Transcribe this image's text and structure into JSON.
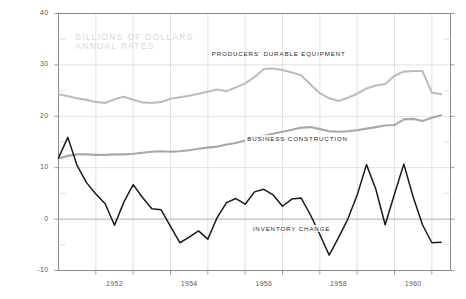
{
  "chart_data": {
    "type": "line",
    "title": "",
    "subtitle": "",
    "annotations": [
      {
        "id": "units",
        "line1": "BILLIONS OF DOLLARS",
        "line2": "ANNUAL RATES"
      }
    ],
    "xlabel": "",
    "ylabel": "",
    "ylim": [
      -10,
      40
    ],
    "xlim": [
      1951.0,
      1961.5
    ],
    "yticks": [
      -10,
      0,
      10,
      20,
      30,
      40
    ],
    "ytick_labels": [
      "-10",
      "0",
      "10",
      "20",
      "30",
      "40"
    ],
    "xticks": [
      1952,
      1954,
      1956,
      1958,
      1960
    ],
    "xtick_labels": [
      "1952",
      "1954",
      "1956",
      "1958",
      "1960"
    ],
    "x_gridlines": [
      1952,
      1953,
      1954,
      1955,
      1956,
      1957,
      1958,
      1959,
      1960,
      1961
    ],
    "y_gridlines": [
      0,
      10,
      20,
      30
    ],
    "grid": true,
    "legend_position": "inline-annotation",
    "zero_line": 0,
    "colors": {
      "producers_durable_equipment": "#bdbdbd",
      "business_construction": "#a8a8a8",
      "inventory_change": "#1a1a1a",
      "grid": "#d9d9d9",
      "axis": "#8c8c8c",
      "tick_text": "#5a5a5a",
      "watermark": "#d8d8d8",
      "background": "#ffffff"
    },
    "x": [
      1951.0,
      1951.25,
      1951.5,
      1951.75,
      1952.0,
      1952.25,
      1952.5,
      1952.75,
      1953.0,
      1953.25,
      1953.5,
      1953.75,
      1954.0,
      1954.25,
      1954.5,
      1954.75,
      1955.0,
      1955.25,
      1955.5,
      1955.75,
      1956.0,
      1956.25,
      1956.5,
      1956.75,
      1957.0,
      1957.25,
      1957.5,
      1957.75,
      1958.0,
      1958.25,
      1958.5,
      1958.75,
      1959.0,
      1959.25,
      1959.5,
      1959.75,
      1960.0,
      1960.25,
      1960.5,
      1960.75,
      1961.0,
      1961.25
    ],
    "series": [
      {
        "name": "PRODUCERS' DURABLE EQUIPMENT",
        "label_x": 1955.05,
        "label_y": 32.2,
        "color": "#bdbdbd",
        "width": 2.1,
        "values": [
          24.3,
          23.9,
          23.5,
          23.2,
          22.8,
          22.6,
          23.3,
          23.8,
          23.2,
          22.7,
          22.6,
          22.8,
          23.4,
          23.7,
          24.0,
          24.4,
          24.8,
          25.2,
          24.9,
          25.6,
          26.4,
          27.6,
          29.2,
          29.3,
          29.0,
          28.5,
          28.0,
          26.2,
          24.5,
          23.5,
          23.0,
          23.6,
          24.4,
          25.4,
          26.0,
          26.3,
          27.9,
          28.7,
          28.8,
          28.8,
          24.6,
          24.3
        ]
      },
      {
        "name": "BUSINESS CONSTRUCTION",
        "label_x": 1956.0,
        "label_y": 15.6,
        "color": "#a8a8a8",
        "width": 2.1,
        "values": [
          11.8,
          12.3,
          12.6,
          12.6,
          12.5,
          12.5,
          12.6,
          12.6,
          12.7,
          12.9,
          13.1,
          13.2,
          13.1,
          13.2,
          13.4,
          13.7,
          13.9,
          14.1,
          14.5,
          14.8,
          15.3,
          15.8,
          16.2,
          16.6,
          17.0,
          17.4,
          17.8,
          17.9,
          17.5,
          17.1,
          17.0,
          17.1,
          17.3,
          17.6,
          17.9,
          18.2,
          18.3,
          19.4,
          19.5,
          19.1,
          19.7,
          20.2
        ]
      },
      {
        "name": "INVENTORY CHANGE",
        "label_x": 1956.15,
        "label_y": -1.9,
        "color": "#1a1a1a",
        "width": 1.5,
        "values": [
          11.9,
          15.9,
          10.4,
          7.1,
          4.9,
          3.0,
          -1.2,
          3.3,
          6.7,
          4.2,
          2.0,
          1.8,
          -1.4,
          -4.6,
          -3.5,
          -2.3,
          -3.9,
          0.3,
          3.2,
          4.0,
          2.9,
          5.3,
          5.8,
          4.7,
          2.5,
          3.9,
          4.1,
          0.8,
          -3.0,
          -7.0,
          -3.6,
          0.0,
          4.7,
          10.6,
          5.8,
          -1.1,
          4.9,
          10.7,
          4.3,
          -1.1,
          -4.6,
          -4.5
        ]
      }
    ]
  }
}
